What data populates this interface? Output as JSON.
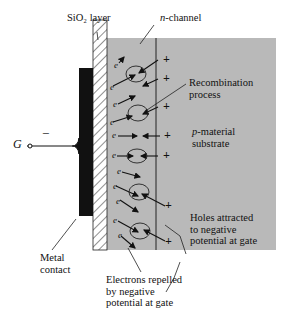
{
  "labels": {
    "sio2": "SiO₂ layer",
    "n_channel": "n-channel",
    "recombination_1": "Recombination",
    "recombination_2": "process",
    "p_material_1": "p-material",
    "p_material_2": "substrate",
    "gate": "G",
    "gate_sign": "−",
    "metal_1": "Metal",
    "metal_2": "contact",
    "holes_1": "Holes attracted",
    "holes_2": "to negative",
    "holes_3": "potential at gate",
    "electrons_1": "Electrons repelled",
    "electrons_2": "by negative",
    "electrons_3": "potential at gate"
  },
  "symbols": {
    "electron": "e",
    "hole": "+"
  },
  "colors": {
    "substrate": "#b9b9b9",
    "metal": "#111111",
    "line": "#222222"
  }
}
